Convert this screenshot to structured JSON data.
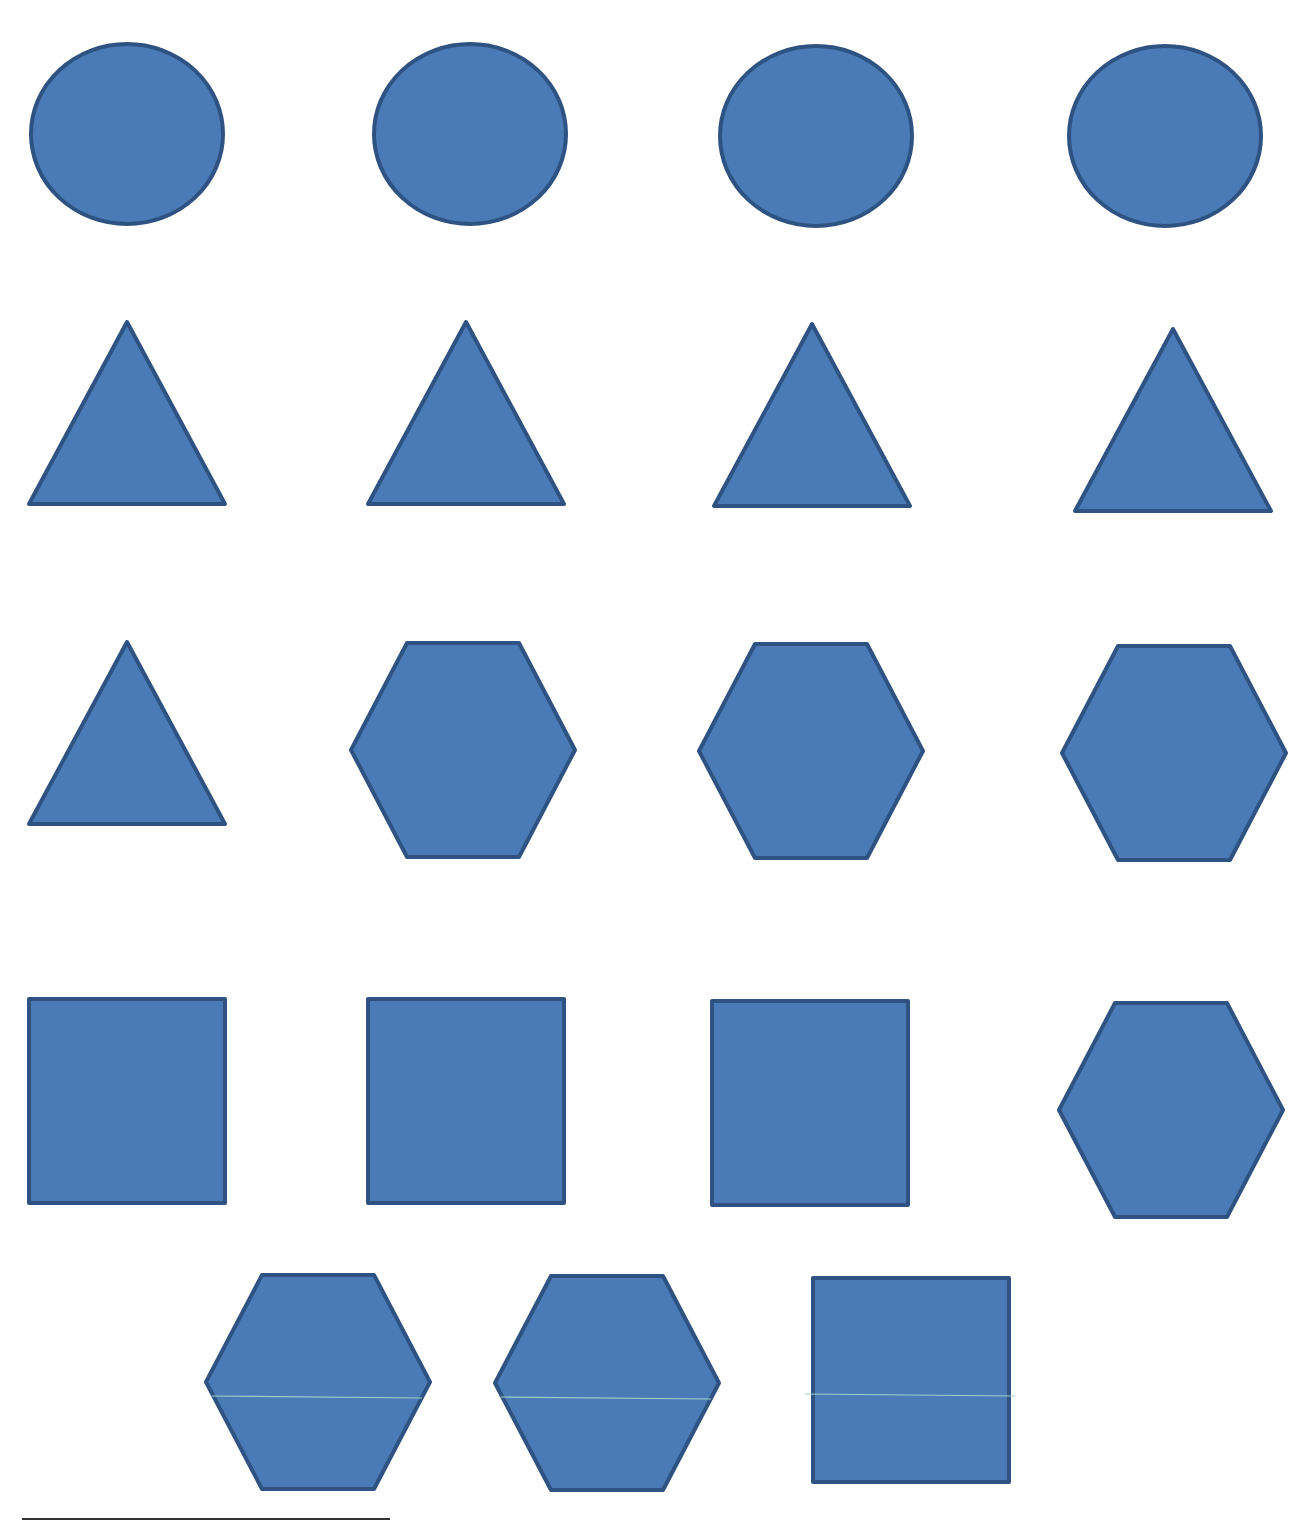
{
  "page": {
    "colors": {
      "fill": "#4a7bb7",
      "stroke": "#2e5382",
      "seam": "#9fd0c8"
    }
  },
  "rows": [
    {
      "shapes": [
        "circle",
        "circle",
        "circle",
        "circle"
      ]
    },
    {
      "shapes": [
        "triangle",
        "triangle",
        "triangle",
        "triangle"
      ]
    },
    {
      "shapes": [
        "triangle",
        "hexagon",
        "hexagon",
        "hexagon"
      ]
    },
    {
      "shapes": [
        "square",
        "square",
        "square",
        "hexagon"
      ]
    },
    {
      "shapes": [
        "hexagon",
        "hexagon",
        "square"
      ]
    }
  ],
  "counts": {
    "circle": 4,
    "triangle": 5,
    "hexagon": 6,
    "square": 4,
    "total": 19
  }
}
